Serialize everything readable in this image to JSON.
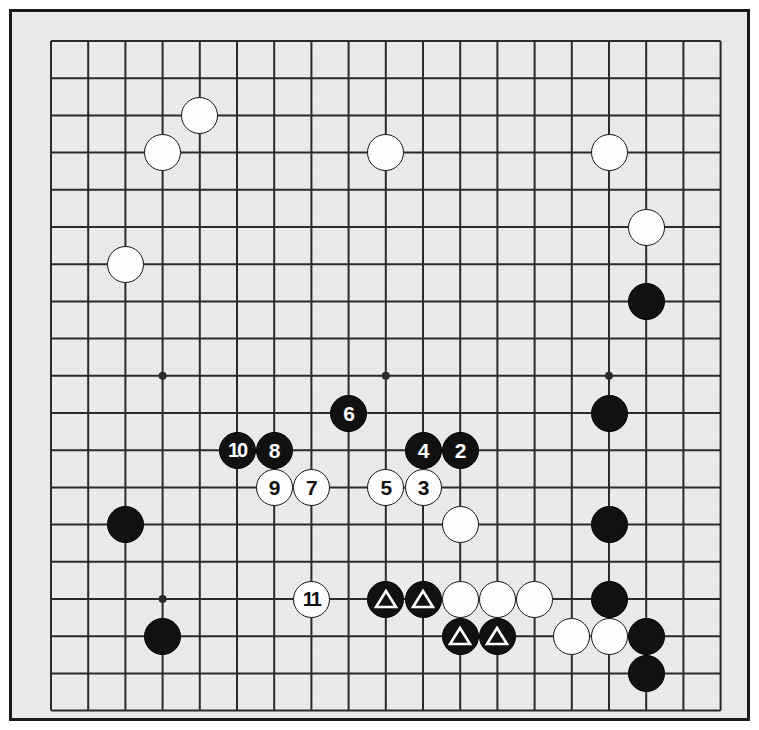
{
  "diagram": {
    "type": "go-board-diagram",
    "board_size": 19,
    "background_color": "#ebebeb",
    "line_color": "#2b2b2b",
    "frame_color": "#1b1b1b",
    "black_color": "#111111",
    "white_color": "#fdfdfd",
    "geometry": {
      "origin_x": 39,
      "origin_y": 29,
      "step": 37.2,
      "stone_diameter": 37,
      "visible_columns": 19,
      "visible_rows": 19
    },
    "star_points": [
      {
        "col": 3,
        "row": 3
      },
      {
        "col": 9,
        "row": 3
      },
      {
        "col": 15,
        "row": 3
      },
      {
        "col": 3,
        "row": 9
      },
      {
        "col": 9,
        "row": 9
      },
      {
        "col": 15,
        "row": 9
      },
      {
        "col": 3,
        "row": 15
      },
      {
        "col": 9,
        "row": 15
      },
      {
        "col": 15,
        "row": 15
      }
    ],
    "stones": [
      {
        "id": "w-d17",
        "color": "white",
        "col": 4,
        "row": 2,
        "label": "",
        "marker": "none"
      },
      {
        "id": "w-c16",
        "color": "white",
        "col": 3,
        "row": 3,
        "label": "",
        "marker": "none"
      },
      {
        "id": "w-k16",
        "color": "white",
        "col": 9,
        "row": 3,
        "label": "",
        "marker": "none"
      },
      {
        "id": "w-r16",
        "color": "white",
        "col": 15,
        "row": 3,
        "label": "",
        "marker": "none"
      },
      {
        "id": "w-s14",
        "color": "white",
        "col": 16,
        "row": 5,
        "label": "",
        "marker": "none"
      },
      {
        "id": "b-s12",
        "color": "black",
        "col": 16,
        "row": 7,
        "label": "",
        "marker": "none"
      },
      {
        "id": "w-b13",
        "color": "white",
        "col": 2,
        "row": 6,
        "label": "",
        "marker": "none"
      },
      {
        "id": "b-r10",
        "color": "black",
        "col": 15,
        "row": 10,
        "label": "",
        "marker": "none"
      },
      {
        "id": "b-6",
        "color": "black",
        "col": 8,
        "row": 10,
        "label": "6",
        "marker": "none"
      },
      {
        "id": "b-10",
        "color": "black",
        "col": 5,
        "row": 11,
        "label": "10",
        "marker": "none"
      },
      {
        "id": "b-8",
        "color": "black",
        "col": 6,
        "row": 11,
        "label": "8",
        "marker": "none"
      },
      {
        "id": "b-4",
        "color": "black",
        "col": 10,
        "row": 11,
        "label": "4",
        "marker": "none"
      },
      {
        "id": "b-2",
        "color": "black",
        "col": 11,
        "row": 11,
        "label": "2",
        "marker": "none"
      },
      {
        "id": "w-9",
        "color": "white",
        "col": 6,
        "row": 12,
        "label": "9",
        "marker": "none"
      },
      {
        "id": "w-7",
        "color": "white",
        "col": 7,
        "row": 12,
        "label": "7",
        "marker": "none"
      },
      {
        "id": "w-5",
        "color": "white",
        "col": 9,
        "row": 12,
        "label": "5",
        "marker": "none"
      },
      {
        "id": "w-3",
        "color": "white",
        "col": 10,
        "row": 12,
        "label": "3",
        "marker": "none"
      },
      {
        "id": "w-m8",
        "color": "white",
        "col": 11,
        "row": 13,
        "label": "",
        "marker": "none"
      },
      {
        "id": "b-c8",
        "color": "black",
        "col": 2,
        "row": 13,
        "label": "",
        "marker": "none"
      },
      {
        "id": "b-r8",
        "color": "black",
        "col": 15,
        "row": 13,
        "label": "",
        "marker": "none"
      },
      {
        "id": "w-11",
        "color": "white",
        "col": 7,
        "row": 15,
        "label": "11",
        "marker": "none"
      },
      {
        "id": "b-t1",
        "color": "black",
        "col": 9,
        "row": 15,
        "label": "",
        "marker": "triangle"
      },
      {
        "id": "b-t2",
        "color": "black",
        "col": 10,
        "row": 15,
        "label": "",
        "marker": "triangle"
      },
      {
        "id": "w-l6a",
        "color": "white",
        "col": 11,
        "row": 15,
        "label": "",
        "marker": "none"
      },
      {
        "id": "w-l6b",
        "color": "white",
        "col": 12,
        "row": 15,
        "label": "",
        "marker": "none"
      },
      {
        "id": "w-l6c",
        "color": "white",
        "col": 13,
        "row": 15,
        "label": "",
        "marker": "none"
      },
      {
        "id": "b-r6",
        "color": "black",
        "col": 15,
        "row": 15,
        "label": "",
        "marker": "none"
      },
      {
        "id": "b-t3",
        "color": "black",
        "col": 11,
        "row": 16,
        "label": "",
        "marker": "triangle"
      },
      {
        "id": "b-t4",
        "color": "black",
        "col": 12,
        "row": 16,
        "label": "",
        "marker": "triangle"
      },
      {
        "id": "w-n5",
        "color": "white",
        "col": 14,
        "row": 16,
        "label": "",
        "marker": "none"
      },
      {
        "id": "w-o5",
        "color": "white",
        "col": 15,
        "row": 16,
        "label": "",
        "marker": "none"
      },
      {
        "id": "b-s5",
        "color": "black",
        "col": 16,
        "row": 16,
        "label": "",
        "marker": "none"
      },
      {
        "id": "b-s4",
        "color": "black",
        "col": 16,
        "row": 17,
        "label": "",
        "marker": "none"
      },
      {
        "id": "b-d4",
        "color": "black",
        "col": 3,
        "row": 16,
        "label": "",
        "marker": "none"
      }
    ]
  }
}
